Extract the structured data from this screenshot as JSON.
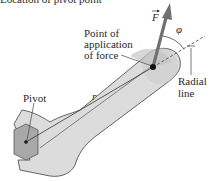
{
  "caption_fragment": "Location of pivot point",
  "labels": {
    "point_of_application": [
      "Point of",
      "application",
      "of force"
    ],
    "force": "F",
    "angle": "φ",
    "radial_line": [
      "Radial",
      "line"
    ],
    "pivot": "Pivot",
    "radius": "r"
  },
  "colors": {
    "wrench_fill": "#d9d9d9",
    "wrench_stroke": "#555555",
    "nut_fill": "#a9a9a9",
    "force_arrow": "#6e6e6e",
    "text": "#2a2a2a"
  }
}
